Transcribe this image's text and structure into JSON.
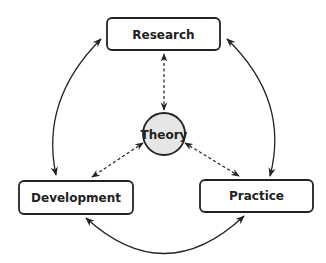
{
  "diagram": {
    "nodes": {
      "research": {
        "label": "Research"
      },
      "theory": {
        "label": "Theory"
      },
      "development": {
        "label": "Development"
      },
      "practice": {
        "label": "Practice"
      }
    },
    "edges": [
      {
        "from": "research",
        "to": "development",
        "style": "solid",
        "direction": "both"
      },
      {
        "from": "research",
        "to": "practice",
        "style": "solid",
        "direction": "both"
      },
      {
        "from": "development",
        "to": "practice",
        "style": "solid",
        "direction": "both"
      },
      {
        "from": "theory",
        "to": "research",
        "style": "dashed",
        "direction": "both"
      },
      {
        "from": "theory",
        "to": "development",
        "style": "dashed",
        "direction": "both"
      },
      {
        "from": "theory",
        "to": "practice",
        "style": "dashed",
        "direction": "both"
      }
    ],
    "colors": {
      "stroke": "#222222",
      "theory_fill": "#e6e6e6",
      "box_fill": "#ffffff"
    }
  }
}
